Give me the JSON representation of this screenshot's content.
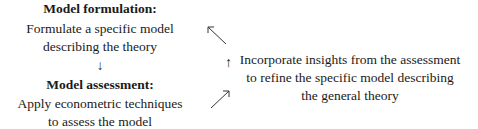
{
  "formulation": {
    "title": "Model formulation:",
    "lines": [
      "Formulate a specific model",
      "describing the theory"
    ]
  },
  "down_arrow": "↓",
  "assessment": {
    "title": "Model assessment:",
    "lines": [
      "Apply econometric techniques",
      "to assess the model"
    ]
  },
  "up_arrow": "↑",
  "feedback": {
    "lines": [
      "Incorporate insights from the assessment",
      "to refine the specific model describing",
      "the general theory"
    ]
  },
  "colors": {
    "text": "#1a1a1a",
    "background": "#ffffff"
  }
}
